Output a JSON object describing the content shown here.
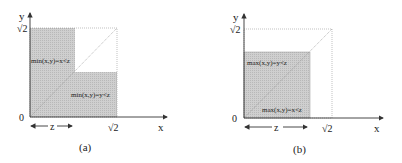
{
  "colors": {
    "shade": "#c9c9c9",
    "axis": "#333333",
    "text": "#222222",
    "background": "#ffffff"
  },
  "panel_a": {
    "caption": "(a)",
    "x_axis_label": "x",
    "y_axis_label": "y",
    "origin_label": "0",
    "x_tick_label": "√2",
    "y_tick_label": "√2",
    "z_label": "z",
    "region_upper_left": "min(x,y)=x<z",
    "region_lower_right": "min(x,y)=y<z"
  },
  "panel_b": {
    "caption": "(b)",
    "x_axis_label": "x",
    "y_axis_label": "y",
    "origin_label": "0",
    "x_tick_label": "√2",
    "y_tick_label": "√2",
    "z_label": "z",
    "region_upper_left": "max(x,y)=y<z",
    "region_lower_right": "max(x,y)=x<z"
  }
}
